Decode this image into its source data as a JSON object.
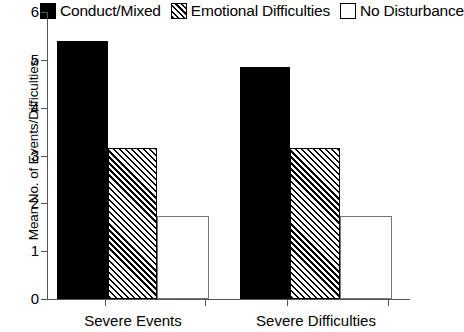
{
  "chart_data": {
    "type": "bar",
    "title": "",
    "xlabel": "",
    "ylabel": "Mean No. of Events/Difficulties",
    "categories": [
      "Severe Events",
      "Severe Difficulties"
    ],
    "ylim": [
      0,
      6
    ],
    "yticks": [
      0,
      1,
      2,
      3,
      4,
      5,
      6
    ],
    "ytick_labels": [
      "0",
      "1",
      "2",
      "3",
      "4",
      "5",
      "6"
    ],
    "grid": false,
    "legend_position": "top",
    "series": [
      {
        "name": "Conduct/Mixed",
        "fill": "solid-black",
        "color": "#000000",
        "values": [
          5.4,
          4.85
        ]
      },
      {
        "name": "Emotional Difficulties",
        "fill": "diagonal-hatch",
        "color": "#000000",
        "values": [
          3.15,
          3.15
        ]
      },
      {
        "name": "No Disturbance",
        "fill": "open-white",
        "color": "#ffffff",
        "values": [
          1.73,
          1.73
        ]
      }
    ]
  },
  "legend": {
    "items": [
      {
        "label": "Conduct/Mixed",
        "swatch": "solid-black-swatch-icon"
      },
      {
        "label": "Emotional Difficulties",
        "swatch": "hatched-swatch-icon"
      },
      {
        "label": "No Disturbance",
        "swatch": "open-swatch-icon"
      }
    ]
  },
  "axes": {
    "y_title": "Mean No. of Events/Difficulties",
    "y_ticks": [
      "0",
      "1",
      "2",
      "3",
      "4",
      "5",
      "6"
    ],
    "x_categories": [
      "Severe Events",
      "Severe Difficulties"
    ]
  }
}
